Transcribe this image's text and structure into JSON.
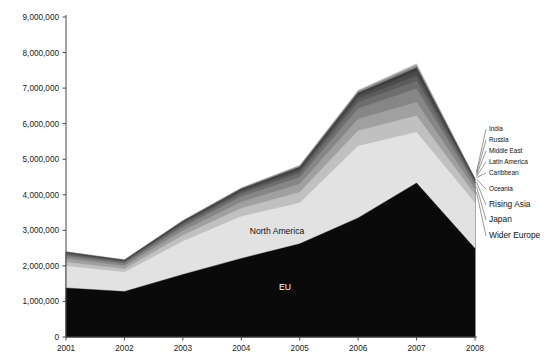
{
  "figure": {
    "kind": "stacked-area-chart",
    "background": "#ffffff"
  },
  "axes": {
    "y_ticks": [
      "9,000,000",
      "8,000,000",
      "7,000,000",
      "6,000,000",
      "5,000,000",
      "4,000,000",
      "3,000,000",
      "2,000,000",
      "1,000,000",
      "0"
    ],
    "x_ticks": [
      "2001",
      "2002",
      "2003",
      "2004",
      "2005",
      "2006",
      "2007",
      "2008"
    ]
  },
  "inner_labels": [
    {
      "text": "North America",
      "x": 277,
      "y": 234,
      "tone": "dark"
    },
    {
      "text": "EU",
      "x": 285,
      "y": 290,
      "tone": "light"
    }
  ],
  "callouts": [
    {
      "text": "India",
      "lx": 489,
      "ly": 131,
      "ax": 476.5,
      "ay": 172.0,
      "size": "small"
    },
    {
      "text": "Russia",
      "lx": 489,
      "ly": 142,
      "ax": 476.5,
      "ay": 173.6,
      "size": "small"
    },
    {
      "text": "Middle East",
      "lx": 489,
      "ly": 153,
      "ax": 476.5,
      "ay": 175.0,
      "size": "small"
    },
    {
      "text": "Latin America",
      "lx": 489,
      "ly": 164,
      "ax": 476.5,
      "ay": 176.4,
      "size": "small"
    },
    {
      "text": "Caribbean",
      "lx": 489,
      "ly": 175,
      "ax": 476.5,
      "ay": 177.6,
      "size": "small"
    },
    {
      "text": "Oceania",
      "lx": 489,
      "ly": 191,
      "ax": 476.5,
      "ay": 179.2,
      "size": "small"
    },
    {
      "text": "Rising Asia",
      "lx": 489,
      "ly": 207,
      "ax": 476.5,
      "ay": 182.0,
      "size": "big"
    },
    {
      "text": "Japan",
      "lx": 489,
      "ly": 222,
      "ax": 476.5,
      "ay": 186.5,
      "size": "big"
    },
    {
      "text": "Wider Europe",
      "lx": 489,
      "ly": 238,
      "ax": 476.5,
      "ay": 192.0,
      "size": "big"
    }
  ],
  "chart_data": {
    "type": "area",
    "title": "",
    "subtitle": "",
    "xlabel": "",
    "ylabel": "",
    "stacked": true,
    "grid": false,
    "legend_position": "right-callouts",
    "categories": [
      "2001",
      "2002",
      "2003",
      "2004",
      "2005",
      "2006",
      "2007",
      "2008"
    ],
    "ylim": [
      0,
      9000000
    ],
    "ytick_step": 1000000,
    "series": [
      {
        "name": "EU",
        "color": "#0a0a0a",
        "values": [
          1380000,
          1280000,
          1760000,
          2210000,
          2620000,
          3350000,
          4330000,
          2490000
        ]
      },
      {
        "name": "North America",
        "color": "#e2e2e2",
        "values": [
          620000,
          540000,
          930000,
          1180000,
          1150000,
          2020000,
          1430000,
          1280000
        ]
      },
      {
        "name": "Wider Europe",
        "color": "#c0c0c0",
        "values": [
          110000,
          95000,
          170000,
          230000,
          300000,
          430000,
          460000,
          230000
        ]
      },
      {
        "name": "Japan",
        "color": "#a0a0a0",
        "values": [
          95000,
          85000,
          130000,
          180000,
          230000,
          330000,
          380000,
          160000
        ]
      },
      {
        "name": "Rising Asia",
        "color": "#868686",
        "values": [
          70000,
          62000,
          105000,
          145000,
          190000,
          300000,
          380000,
          130000
        ]
      },
      {
        "name": "Oceania",
        "color": "#6e6e6e",
        "values": [
          45000,
          40000,
          62000,
          85000,
          110000,
          170000,
          220000,
          62000
        ]
      },
      {
        "name": "Caribbean",
        "color": "#5c5c5c",
        "values": [
          28000,
          25000,
          40000,
          55000,
          72000,
          110000,
          150000,
          38000
        ]
      },
      {
        "name": "Latin America",
        "color": "#4b4b4b",
        "values": [
          22000,
          20000,
          33000,
          45000,
          60000,
          90000,
          125000,
          30000
        ]
      },
      {
        "name": "Middle East",
        "color": "#3d3d3d",
        "values": [
          15000,
          14000,
          24000,
          33000,
          44000,
          66000,
          95000,
          22000
        ]
      },
      {
        "name": "Russia",
        "color": "#8a8a8a",
        "values": [
          10000,
          9000,
          16000,
          22000,
          30000,
          45000,
          68000,
          15000
        ]
      },
      {
        "name": "India",
        "color": "#b4b4b4",
        "values": [
          7000,
          6000,
          11000,
          15000,
          21000,
          32000,
          50000,
          10000
        ]
      }
    ],
    "totals": [
      2402000,
      2175000,
      3281000,
      4201000,
      4827000,
      6943000,
      7688000,
      4467000
    ]
  }
}
